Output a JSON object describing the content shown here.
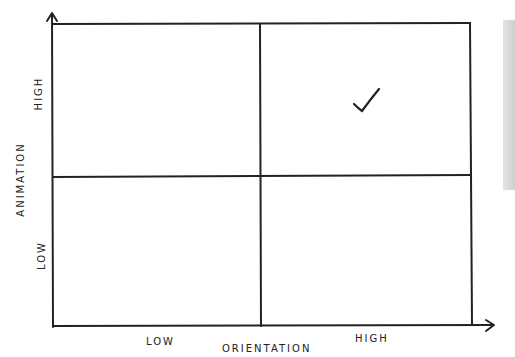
{
  "diagram": {
    "type": "2x2-matrix",
    "x_axis": {
      "title": "ORIENTATION",
      "low_label": "LOW",
      "high_label": "HIGH"
    },
    "y_axis": {
      "title": "ANIMATION",
      "low_label": "LOW",
      "high_label": "HIGH"
    },
    "quadrants": [
      {
        "position": "top-left",
        "x": "low",
        "y": "high",
        "mark": ""
      },
      {
        "position": "top-right",
        "x": "high",
        "y": "high",
        "mark": "checkmark"
      },
      {
        "position": "bottom-left",
        "x": "low",
        "y": "low",
        "mark": ""
      },
      {
        "position": "bottom-right",
        "x": "high",
        "y": "low",
        "mark": ""
      }
    ],
    "colors": {
      "line": "#222222",
      "background": "#ffffff"
    }
  }
}
